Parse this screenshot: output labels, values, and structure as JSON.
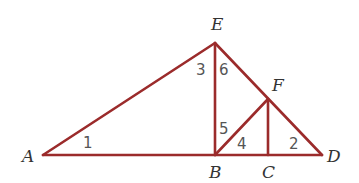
{
  "diagram": {
    "type": "geometry",
    "line_color": "#9b2b2b",
    "points": {
      "A": {
        "label": "A",
        "x": 43,
        "y": 155
      },
      "B": {
        "label": "B",
        "x": 215,
        "y": 155
      },
      "C": {
        "label": "C",
        "x": 268,
        "y": 155
      },
      "D": {
        "label": "D",
        "x": 322,
        "y": 155
      },
      "E": {
        "label": "E",
        "x": 215,
        "y": 43
      },
      "F": {
        "label": "F",
        "x": 268,
        "y": 99
      }
    },
    "segments": [
      "AD",
      "AE",
      "ED",
      "EB",
      "BF",
      "FC"
    ],
    "angle_labels": {
      "a1": "1",
      "a2": "2",
      "a3": "3",
      "a4": "4",
      "a5": "5",
      "a6": "6"
    }
  }
}
